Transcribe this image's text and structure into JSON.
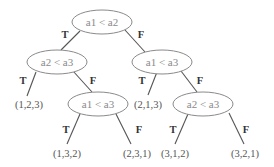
{
  "diagram": {
    "type": "decision-tree",
    "nodes": {
      "root": {
        "label": "a1 < a2"
      },
      "n_l": {
        "label": "a2 < a3"
      },
      "n_r": {
        "label": "a1 < a3"
      },
      "n_lr": {
        "label": "a1 < a3"
      },
      "n_rr": {
        "label": "a2 < a3"
      }
    },
    "leaves": {
      "l_123": {
        "label": "(1,2,3)"
      },
      "l_213": {
        "label": "(2,1,3)"
      },
      "l_132": {
        "label": "(1,3,2)"
      },
      "l_231": {
        "label": "(2,3,1)"
      },
      "l_312": {
        "label": "(3,1,2)"
      },
      "l_321": {
        "label": "(3,2,1)"
      }
    },
    "edge_labels": {
      "true": "T",
      "false": "F"
    },
    "edges": [
      {
        "from": "root",
        "to": "n_l",
        "label": "T"
      },
      {
        "from": "root",
        "to": "n_r",
        "label": "F"
      },
      {
        "from": "n_l",
        "to": "l_123",
        "label": "T"
      },
      {
        "from": "n_l",
        "to": "n_lr",
        "label": "F"
      },
      {
        "from": "n_r",
        "to": "l_213",
        "label": "T"
      },
      {
        "from": "n_r",
        "to": "n_rr",
        "label": "F"
      },
      {
        "from": "n_lr",
        "to": "l_132",
        "label": "T"
      },
      {
        "from": "n_lr",
        "to": "l_231",
        "label": "F"
      },
      {
        "from": "n_rr",
        "to": "l_312",
        "label": "T"
      },
      {
        "from": "n_rr",
        "to": "l_321",
        "label": "F"
      }
    ]
  }
}
